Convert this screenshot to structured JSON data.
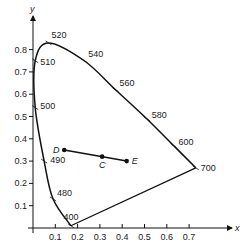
{
  "chart_data": {
    "type": "line",
    "title": "",
    "xlabel": "x",
    "ylabel": "y",
    "xlim": [
      0,
      0.8
    ],
    "ylim": [
      0,
      0.9
    ],
    "grid": false,
    "x_ticks": [
      "0.1",
      "0.2",
      "0.3",
      "0.4",
      "0.5",
      "0.6",
      "0.7"
    ],
    "y_ticks": [
      "0.1",
      "0.2",
      "0.3",
      "0.4",
      "0.5",
      "0.6",
      "0.7",
      "0.8"
    ],
    "spectral_locus": {
      "name": "spectral locus",
      "points": [
        {
          "nm": 400,
          "x": 0.17,
          "y": 0.01
        },
        {
          "nm": 480,
          "x": 0.09,
          "y": 0.13
        },
        {
          "nm": 490,
          "x": 0.05,
          "y": 0.3
        },
        {
          "nm": 500,
          "x": 0.01,
          "y": 0.54
        },
        {
          "nm": 510,
          "x": 0.01,
          "y": 0.75
        },
        {
          "nm": 520,
          "x": 0.07,
          "y": 0.83
        },
        {
          "nm": 540,
          "x": 0.23,
          "y": 0.75
        },
        {
          "nm": 560,
          "x": 0.37,
          "y": 0.62
        },
        {
          "nm": 580,
          "x": 0.51,
          "y": 0.49
        },
        {
          "nm": 600,
          "x": 0.63,
          "y": 0.37
        },
        {
          "nm": 700,
          "x": 0.73,
          "y": 0.27
        }
      ]
    },
    "purple_line": {
      "from_nm": 400,
      "to_nm": 700
    },
    "points": [
      {
        "label": "D",
        "x": 0.14,
        "y": 0.35
      },
      {
        "label": "C",
        "x": 0.31,
        "y": 0.32
      },
      {
        "label": "E",
        "x": 0.42,
        "y": 0.3
      }
    ],
    "segment": {
      "from": "D",
      "to": "E",
      "through": "C"
    }
  },
  "colors": {
    "line": "#111111",
    "text": "#222222",
    "background": "#ffffff"
  }
}
